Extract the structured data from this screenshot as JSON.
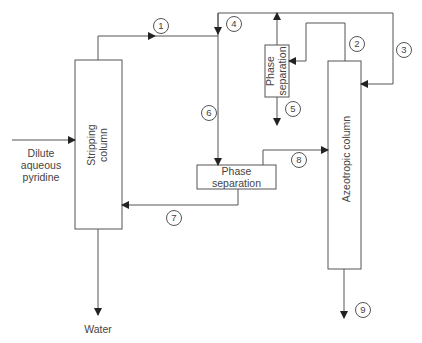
{
  "diagram": {
    "units": {
      "stripping_column": {
        "label_line1": "Stripping",
        "label_line2": "column"
      },
      "azeotropic_column": {
        "label": "Azeotropic column"
      },
      "phase_sep_top": {
        "label_line1": "Phase",
        "label_line2": "separation"
      },
      "phase_sep_bottom": {
        "label_line1": "Phase",
        "label_line2": "separation"
      }
    },
    "feed": {
      "line1": "Dilute",
      "line2": "aqueous",
      "line3": "pyridine"
    },
    "outlet_water": "Water",
    "streams": [
      "1",
      "2",
      "3",
      "4",
      "5",
      "6",
      "7",
      "8",
      "9"
    ],
    "colors": {
      "line": "#444444",
      "text": "#444444",
      "background": "#ffffff"
    }
  }
}
